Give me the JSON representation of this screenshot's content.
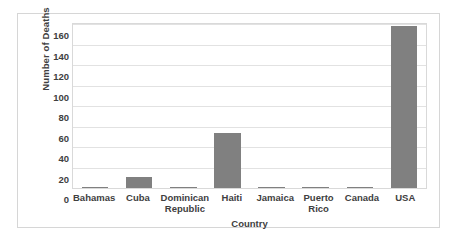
{
  "chart_data": {
    "type": "bar",
    "title": "",
    "xlabel": "Country",
    "ylabel": "Number of Deaths",
    "categories": [
      "Bahamas",
      "Cuba",
      "Dominican Republic",
      "Haiti",
      "Jamaica",
      "Puerto Rico",
      "Canada",
      "USA"
    ],
    "values": [
      1,
      11,
      1,
      54,
      1,
      1,
      1,
      158
    ],
    "ylim": [
      0,
      160
    ],
    "yticks": [
      0,
      20,
      40,
      60,
      80,
      100,
      120,
      140,
      160
    ],
    "ytick_labels": [
      "0",
      "20",
      "40",
      "60",
      "80",
      "100",
      "120",
      "140",
      "160"
    ],
    "grid": true,
    "legend": false,
    "bar_color": "#808080",
    "gridline_color": "#e2e2e2",
    "text_color": "#404040",
    "plot_border_color": "#d9d9d9",
    "frame_border_color": "#d6d6d6"
  }
}
